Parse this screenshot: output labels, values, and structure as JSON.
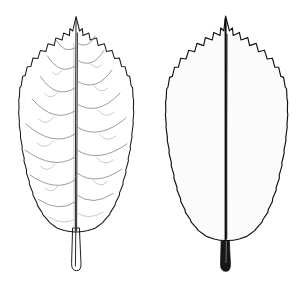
{
  "illustration": {
    "title": "Leaf Illustration Plate",
    "subject": "leaf",
    "medium": "pen-and-ink botanical line drawing",
    "background_color": "#ffffff",
    "ink_color": "#1a1a1a",
    "canvas": {
      "width": 305,
      "height": 285
    },
    "caption": "",
    "labels": [],
    "figure_count": 2
  },
  "figures": [
    {
      "id": "leaf-outline",
      "name": "left-leaf-outline-view",
      "render_style": "outline",
      "description": "Elliptic leaf in pure contour line with pinnate venation, serrate margin, acuminate apex",
      "position": {
        "x": 18,
        "y": 14,
        "width": 118,
        "height": 258
      },
      "apex": "acuminate",
      "base": "cuneate",
      "margin": "serrate",
      "venation": "pinnate",
      "tooth_count": 30,
      "lateral_vein_pairs": 8,
      "stroke_color": "#1a1a1a",
      "vein_color": "#8a8a8a",
      "fill_color": "#ffffff",
      "petiole": {
        "present": true,
        "style": "open-outline",
        "length": 44
      }
    },
    {
      "id": "leaf-stippled",
      "name": "right-leaf-shaded-view",
      "render_style": "stipple-shaded",
      "description": "Same leaf rendered with dense stipple shading, dark midrib, highlighted veins",
      "position": {
        "x": 162,
        "y": 14,
        "width": 130,
        "height": 258
      },
      "apex": "acuminate",
      "base": "cuneate",
      "margin": "serrate",
      "venation": "pinnate",
      "tooth_count": 30,
      "lateral_vein_pairs": 8,
      "stroke_color": "#111111",
      "stipple_color": "#1b1b1b",
      "stipple_density": "medium-high",
      "fill_color": "#f6f6f6",
      "petiole": {
        "present": true,
        "style": "solid-dark",
        "length": 44
      }
    }
  ]
}
